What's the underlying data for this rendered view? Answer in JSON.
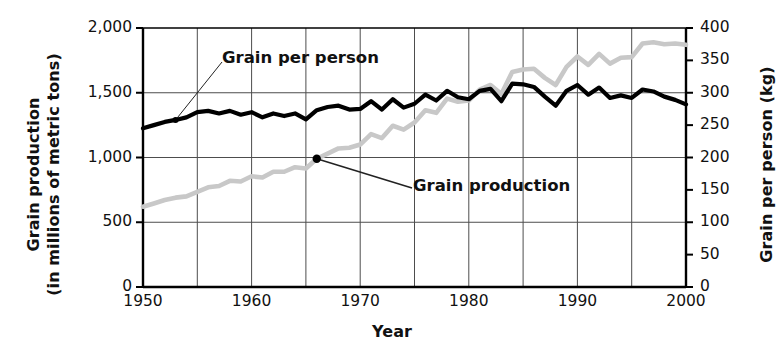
{
  "chart_data": {
    "type": "line",
    "title": "",
    "xlabel": "Year",
    "ylabel": "Grain production (in millions of metric tons)",
    "ylabel2": "Grain per person (kg)",
    "xlim": [
      1950,
      2000
    ],
    "ylim": [
      0,
      2000
    ],
    "ylim2": [
      0,
      400
    ],
    "grid": true,
    "legend_position": "inline-annotations",
    "xticks": [
      1950,
      1960,
      1970,
      1980,
      1990,
      2000
    ],
    "xgridlines": [
      1955,
      1960,
      1965,
      1970,
      1975,
      1980,
      1985,
      1990,
      1995
    ],
    "yticks_left": [
      0,
      500,
      1000,
      1500,
      2000
    ],
    "yticks_right": [
      0,
      50,
      100,
      150,
      200,
      250,
      300,
      350,
      400
    ],
    "ygridlines_left": [
      500,
      1000,
      1500
    ],
    "x": [
      1950,
      1951,
      1952,
      1953,
      1954,
      1955,
      1956,
      1957,
      1958,
      1959,
      1960,
      1961,
      1962,
      1963,
      1964,
      1965,
      1966,
      1967,
      1968,
      1969,
      1970,
      1971,
      1972,
      1973,
      1974,
      1975,
      1976,
      1977,
      1978,
      1979,
      1980,
      1981,
      1982,
      1983,
      1984,
      1985,
      1986,
      1987,
      1988,
      1989,
      1990,
      1991,
      1992,
      1993,
      1994,
      1995,
      1996,
      1997,
      1998,
      1999,
      2000
    ],
    "series": [
      {
        "name": "Grain production",
        "axis": "left",
        "units": "millions of metric tons",
        "color": "#c8c8c8",
        "values": [
          620,
          645,
          672,
          690,
          700,
          735,
          770,
          780,
          820,
          815,
          855,
          845,
          890,
          890,
          925,
          915,
          990,
          1030,
          1070,
          1075,
          1100,
          1180,
          1150,
          1245,
          1215,
          1270,
          1365,
          1345,
          1455,
          1430,
          1440,
          1525,
          1560,
          1490,
          1660,
          1680,
          1685,
          1615,
          1560,
          1700,
          1780,
          1715,
          1800,
          1725,
          1770,
          1775,
          1880,
          1890,
          1875,
          1880,
          1870
        ]
      },
      {
        "name": "Grain per person",
        "axis": "right",
        "units": "kg",
        "color": "#000000",
        "values": [
          245,
          250,
          255,
          258,
          262,
          270,
          272,
          268,
          272,
          266,
          270,
          262,
          268,
          264,
          268,
          259,
          273,
          278,
          280,
          274,
          275,
          287,
          274,
          290,
          277,
          283,
          297,
          288,
          303,
          293,
          290,
          303,
          306,
          287,
          314,
          313,
          309,
          294,
          280,
          303,
          312,
          297,
          308,
          292,
          296,
          292,
          305,
          302,
          294,
          289,
          282
        ]
      }
    ],
    "annotations": [
      {
        "id": "grain-per-person",
        "text": "Grain per person",
        "points_to_series": "Grain per person",
        "points_to_year": 1953
      },
      {
        "id": "grain-production",
        "text": "Grain production",
        "points_to_series": "Grain production",
        "points_to_year": 1966
      }
    ]
  },
  "axes": {
    "left_title_line1": "Grain production",
    "left_title_line2": "(in millions of metric tons)",
    "right_title": "Grain per person (kg)",
    "x_title": "Year"
  },
  "tick_labels": {
    "left": [
      "2,000",
      "1,500",
      "1,000",
      "500",
      "0"
    ],
    "right": [
      "400",
      "350",
      "300",
      "250",
      "200",
      "150",
      "100",
      "50",
      "0"
    ],
    "x": [
      "1950",
      "1960",
      "1970",
      "1980",
      "1990",
      "2000"
    ]
  },
  "annotation_labels": {
    "grain_per_person": "Grain per person",
    "grain_production": "Grain production"
  },
  "colors": {
    "grain_production_line": "#c8c8c8",
    "grain_per_person_line": "#000000",
    "grid": "#4d4d4d",
    "axis": "#000000",
    "background": "#ffffff"
  }
}
